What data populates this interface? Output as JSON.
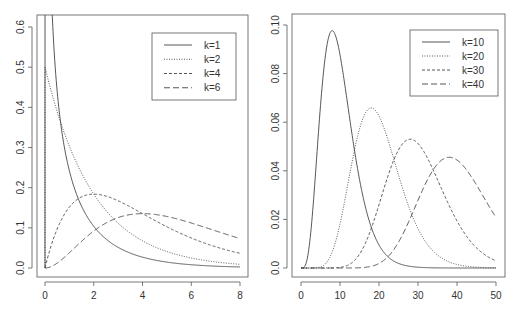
{
  "chart_data": [
    {
      "type": "line",
      "title": "",
      "xlabel": "",
      "ylabel": "",
      "xlim": [
        0,
        8
      ],
      "ylim": [
        0,
        0.6
      ],
      "xticks": [
        0,
        2,
        4,
        6,
        8
      ],
      "xtick_labels": [
        "0",
        "2",
        "4",
        "6",
        "8"
      ],
      "yticks": [
        0.0,
        0.1,
        0.2,
        0.3,
        0.4,
        0.5,
        0.6
      ],
      "ytick_labels": [
        "0.0",
        "0.1",
        "0.2",
        "0.3",
        "0.4",
        "0.5",
        "0.6"
      ],
      "grid": false,
      "legend_position": "top-right",
      "distribution": "chi-square density",
      "series": [
        {
          "name": "k=1",
          "df": 1,
          "linestyle": "solid"
        },
        {
          "name": "k=2",
          "df": 2,
          "linestyle": "dotted"
        },
        {
          "name": "k=4",
          "df": 4,
          "linestyle": "dashed"
        },
        {
          "name": "k=6",
          "df": 6,
          "linestyle": "longdash"
        }
      ],
      "sample_points": {
        "x": [
          0.5,
          1,
          2,
          4,
          6,
          8
        ],
        "k=1": [
          0.484,
          0.242,
          0.104,
          0.027,
          0.008,
          0.002
        ],
        "k=2": [
          0.389,
          0.303,
          0.184,
          0.068,
          0.025,
          0.009
        ],
        "k=4": [
          0.097,
          0.152,
          0.184,
          0.135,
          0.075,
          0.037
        ],
        "k=6": [
          0.01,
          0.038,
          0.092,
          0.135,
          0.112,
          0.073
        ]
      }
    },
    {
      "type": "line",
      "title": "",
      "xlabel": "",
      "ylabel": "",
      "xlim": [
        0,
        50
      ],
      "ylim": [
        0,
        0.1
      ],
      "xticks": [
        0,
        10,
        20,
        30,
        40,
        50
      ],
      "xtick_labels": [
        "0",
        "10",
        "20",
        "30",
        "40",
        "50"
      ],
      "yticks": [
        0.0,
        0.02,
        0.04,
        0.06,
        0.08,
        0.1
      ],
      "ytick_labels": [
        "0.0",
        "0.02",
        "0.04",
        "0.06",
        "0.08",
        "0.10"
      ],
      "grid": false,
      "legend_position": "top-right",
      "distribution": "chi-square density",
      "series": [
        {
          "name": "k=10",
          "df": 10,
          "linestyle": "solid"
        },
        {
          "name": "k=20",
          "df": 20,
          "linestyle": "dotted"
        },
        {
          "name": "k=30",
          "df": 30,
          "linestyle": "dashed"
        },
        {
          "name": "k=40",
          "df": 40,
          "linestyle": "longdash"
        }
      ],
      "sample_points": {
        "x": [
          8,
          18,
          28,
          38,
          50
        ],
        "k=10": [
          0.098,
          0.033,
          0.003,
          0.0002,
          0.0
        ],
        "k=20": [
          0.036,
          0.066,
          0.018,
          0.002,
          0.0
        ],
        "k=30": [
          0.001,
          0.029,
          0.053,
          0.025,
          0.003
        ],
        "k=40": [
          0.0,
          0.003,
          0.026,
          0.046,
          0.021
        ]
      }
    }
  ]
}
